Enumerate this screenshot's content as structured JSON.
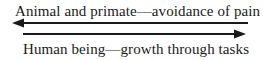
{
  "diagram": {
    "top_label": "Animal and primate—avoidance of pain",
    "bottom_label": "Human being—growth through tasks",
    "arrows": [
      {
        "direction": "left",
        "x_from": 248,
        "x_to": 13,
        "y": 23
      },
      {
        "direction": "right",
        "x_from": 23,
        "x_to": 245,
        "y": 34
      }
    ],
    "colors": {
      "ink": "#1a1a1a",
      "background": "#ffffff"
    }
  }
}
